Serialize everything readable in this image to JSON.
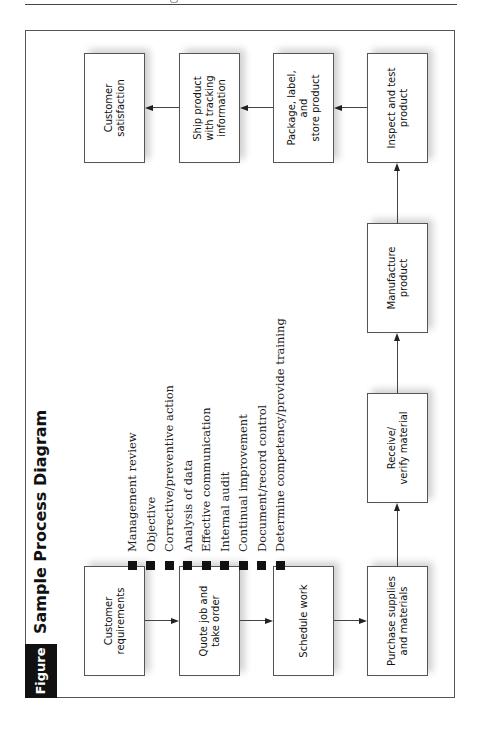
{
  "figure": {
    "label": "Figure 2.1",
    "title": "Sample Process Diagram"
  },
  "process_steps": [
    {
      "id": "customer-requirements",
      "label": "Customer\nrequirements"
    },
    {
      "id": "quote-job",
      "label": "Quote job and\ntake order"
    },
    {
      "id": "schedule-work",
      "label": "Schedule work"
    },
    {
      "id": "purchase-supplies",
      "label": "Purchase supplies\nand materials"
    },
    {
      "id": "receive-verify",
      "label": "Receive/\nverify material"
    },
    {
      "id": "manufacture",
      "label": "Manufacture\nproduct"
    },
    {
      "id": "inspect-test",
      "label": "Inspect and test\nproduct"
    },
    {
      "id": "package-label",
      "label": "Package, label, and\nstore product"
    },
    {
      "id": "ship-product",
      "label": "Ship product\nwith tracking\ninformation"
    },
    {
      "id": "customer-satisfaction",
      "label": "Customer\nsatisfaction"
    }
  ],
  "support_processes": [
    "Management review",
    "Objective",
    "Corrective/preventive action",
    "Analysis of data",
    "Effective communication",
    "Internal audit",
    "Continual improvement",
    "Document/record control",
    "Determine competency/provide training"
  ],
  "flow": [
    [
      "Customer requirements",
      "Quote job and take order"
    ],
    [
      "Quote job and take order",
      "Schedule work"
    ],
    [
      "Schedule work",
      "Purchase supplies and materials"
    ],
    [
      "Purchase supplies and materials",
      "Receive/verify material"
    ],
    [
      "Receive/verify material",
      "Manufacture product"
    ],
    [
      "Manufacture product",
      "Inspect and test product"
    ],
    [
      "Inspect and test product",
      "Package, label, and store product"
    ],
    [
      "Package, label, and store product",
      "Ship product with tracking information"
    ],
    [
      "Ship product with tracking information",
      "Customer satisfaction"
    ]
  ]
}
